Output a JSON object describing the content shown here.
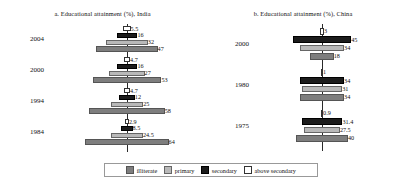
{
  "figure": {
    "width": 401,
    "height": 188,
    "background": "#ffffff"
  },
  "legend": {
    "position": "bottom-center",
    "items": [
      {
        "key": "illiterate",
        "label": "illiterate",
        "color": "#7e7e7e"
      },
      {
        "key": "primary",
        "label": "primary",
        "color": "#b9b9b9"
      },
      {
        "key": "secondary",
        "label": "secondary",
        "color": "#1c1c1c"
      },
      {
        "key": "above_secondary",
        "label": "above secondary",
        "color": "#ffffff"
      }
    ]
  },
  "panels": [
    {
      "id": "india",
      "title": "a. Educational attainment (%), India",
      "years": [
        "2004",
        "2000",
        "1994",
        "1984"
      ]
    },
    {
      "id": "china",
      "title": "b. Educational attainment (%), China",
      "years": [
        "2000",
        "1980",
        "1975"
      ]
    }
  ],
  "chart_data": [
    {
      "type": "bar",
      "id": "india",
      "title": "a. Educational attainment (%), India",
      "orientation": "horizontal-centered-pyramid",
      "categories": [
        "2004",
        "2000",
        "1994",
        "1984"
      ],
      "xlabel": "",
      "ylabel": "",
      "grid": false,
      "legend_position": "bottom",
      "series": [
        {
          "name": "above secondary",
          "color": "#ffffff",
          "values": [
            5.5,
            4.7,
            4.7,
            2.9
          ]
        },
        {
          "name": "secondary",
          "color": "#1c1c1c",
          "values": [
            16,
            16,
            12,
            8.5
          ]
        },
        {
          "name": "primary",
          "color": "#b9b9b9",
          "values": [
            32,
            27,
            25,
            24.5
          ]
        },
        {
          "name": "illiterate",
          "color": "#7e7e7e",
          "values": [
            47,
            53,
            58,
            64
          ]
        }
      ]
    },
    {
      "type": "bar",
      "id": "china",
      "title": "b. Educational attainment (%), China",
      "orientation": "horizontal-centered-pyramid",
      "categories": [
        "2000",
        "1980",
        "1975"
      ],
      "xlabel": "",
      "ylabel": "",
      "grid": false,
      "legend_position": "bottom",
      "series": [
        {
          "name": "above secondary",
          "color": "#ffffff",
          "values": [
            3,
            1,
            0.9
          ]
        },
        {
          "name": "secondary",
          "color": "#1c1c1c",
          "values": [
            45,
            34,
            31.4
          ]
        },
        {
          "name": "primary",
          "color": "#b9b9b9",
          "values": [
            34,
            31,
            27.5
          ]
        },
        {
          "name": "illiterate",
          "color": "#7e7e7e",
          "values": [
            18,
            34,
            40
          ]
        }
      ]
    }
  ]
}
